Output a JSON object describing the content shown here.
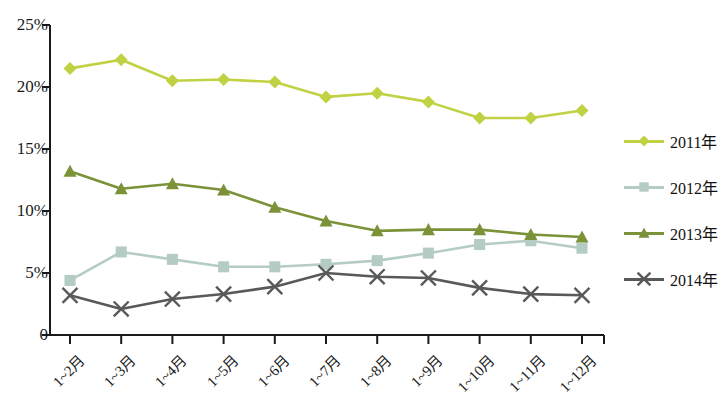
{
  "chart_data": {
    "type": "line",
    "title": "",
    "xlabel": "",
    "ylabel": "",
    "categories": [
      "1~2月",
      "1~3月",
      "1~4月",
      "1~5月",
      "1~6月",
      "1~7月",
      "1~8月",
      "1~9月",
      "1~10月",
      "1~11月",
      "1~12月"
    ],
    "ylim": [
      0,
      25
    ],
    "ytick_labels": [
      "0",
      "5%",
      "10%",
      "15%",
      "20%",
      "25%"
    ],
    "ytick_values": [
      0,
      5,
      10,
      15,
      20,
      25
    ],
    "grid": false,
    "legend_position": "right",
    "series": [
      {
        "name": "2011年",
        "color": "#c0d243",
        "marker": "diamond",
        "values": [
          21.5,
          22.2,
          20.5,
          20.6,
          20.4,
          19.2,
          19.5,
          18.8,
          17.5,
          17.5,
          18.1
        ]
      },
      {
        "name": "2012年",
        "color": "#b5ccc4",
        "marker": "square",
        "values": [
          4.4,
          6.7,
          6.1,
          5.5,
          5.5,
          5.7,
          6.0,
          6.6,
          7.3,
          7.6,
          7.0
        ]
      },
      {
        "name": "2013年",
        "color": "#7b9239",
        "marker": "triangle",
        "values": [
          13.2,
          11.8,
          12.2,
          11.7,
          10.3,
          9.2,
          8.4,
          8.5,
          8.5,
          8.1,
          7.9
        ]
      },
      {
        "name": "2014年",
        "color": "#59595b",
        "marker": "x",
        "values": [
          3.2,
          2.1,
          2.9,
          3.3,
          3.9,
          5.0,
          4.7,
          4.6,
          3.8,
          3.3,
          3.2
        ]
      }
    ]
  },
  "axis": {
    "line_color": "#1a1a1a"
  }
}
